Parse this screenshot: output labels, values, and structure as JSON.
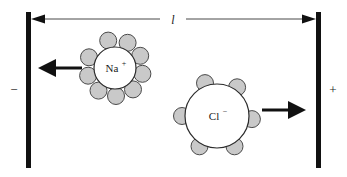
{
  "figure": {
    "type": "electrochemistry-cell-diagram"
  },
  "dimension": {
    "label": "l",
    "meaning": "distance between electrodes",
    "arrow_style": "double-headed"
  },
  "electrodes": {
    "left": {
      "name": "cathode",
      "sign": "−",
      "x": 28,
      "y_top": 12,
      "y_bottom": 168,
      "width": 5,
      "color": "#111111"
    },
    "right": {
      "name": "anode",
      "sign": "+",
      "x": 318,
      "y_top": 12,
      "y_bottom": 168,
      "width": 5,
      "color": "#111111"
    }
  },
  "ions": [
    {
      "id": "sodium",
      "label": "Na",
      "charge": "+",
      "cx": 115,
      "cy": 68,
      "r": 21,
      "fill": "#ffffff",
      "stroke": "#2b2b2b",
      "hydration_count": 9,
      "hydration_radius": 8.5,
      "hydration_orbit": 28,
      "hydration_fill": "#c9c9c9",
      "hydration_stroke": "#4a4a4a",
      "hydration_angles": [
        258,
        296,
        334,
        12,
        50,
        88,
        126,
        164,
        202
      ],
      "migration": "left"
    },
    {
      "id": "chloride",
      "label": "Cl",
      "charge": "−",
      "cx": 217,
      "cy": 116,
      "r": 32,
      "fill": "#ffffff",
      "stroke": "#2b2b2b",
      "hydration_count": 6,
      "hydration_radius": 8.5,
      "hydration_orbit": 35,
      "hydration_fill": "#c9c9c9",
      "hydration_stroke": "#4a4a4a",
      "hydration_angles": [
        250,
        305,
        5,
        60,
        120,
        180
      ],
      "migration": "right"
    }
  ],
  "arrows": {
    "sodium_migration": {
      "direction": "left",
      "x_start": 82,
      "x_end": 40,
      "y": 68,
      "color": "#111111"
    },
    "chloride_migration": {
      "direction": "right",
      "x_start": 262,
      "x_end": 304,
      "y": 110,
      "color": "#111111"
    }
  },
  "colors": {
    "ink": "#111111",
    "hydration_gray": "#c9c9c9",
    "background": "#ffffff"
  }
}
